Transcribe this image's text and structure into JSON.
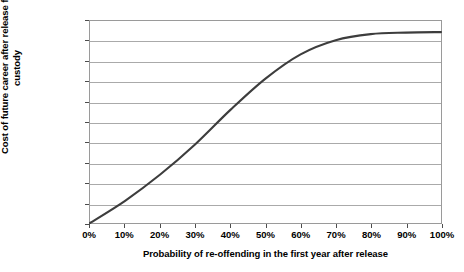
{
  "chart_data": {
    "type": "line",
    "title": "",
    "xlabel": "Probability of re-offending in the first year after release",
    "ylabel": "Cost of future career after release from custody",
    "ylabel_line1": "Cost of future career after release from",
    "ylabel_line2": "custody",
    "x": [
      0,
      10,
      20,
      30,
      40,
      50,
      60,
      70,
      80,
      90,
      100
    ],
    "values": [
      0,
      22000,
      48000,
      78000,
      112000,
      143000,
      167000,
      181000,
      187000,
      188500,
      189000
    ],
    "xtick_labels": [
      "0%",
      "10%",
      "20%",
      "30%",
      "40%",
      "50%",
      "60%",
      "70%",
      "80%",
      "90%",
      "100%"
    ],
    "ytick_labels": [
      "£0",
      "£20,000",
      "£40,000",
      "£60,000",
      "£80,000",
      "£100,000",
      "£120,000",
      "£140,000",
      "£160,000",
      "£180,000",
      "£200,000"
    ],
    "ytick_values": [
      0,
      20000,
      40000,
      60000,
      80000,
      100000,
      120000,
      140000,
      160000,
      180000,
      200000
    ],
    "xlim": [
      0,
      100
    ],
    "ylim": [
      0,
      200000
    ],
    "grid": true,
    "grid_axis": "y",
    "legend": false,
    "series_color": "#3d3d3d",
    "grid_color": "#aaaaaa",
    "axis_color": "#9a9a9a",
    "background": "#ffffff"
  }
}
